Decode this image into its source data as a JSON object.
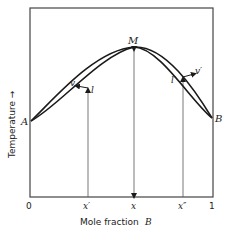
{
  "figure": {
    "y_axis_label": "Temperature →",
    "x_axis_label_prefix": "Mole fraction",
    "x_axis_label_var": "B",
    "x_ticks": [
      "0",
      "x′",
      "x",
      "x″",
      "1"
    ],
    "points": {
      "A": "A",
      "B": "B",
      "M": "M",
      "v": "v",
      "l": "l",
      "v_prime": "v′",
      "l_prime": "l′"
    },
    "colors": {
      "line": "#1a1a1a",
      "frame": "#444444",
      "background": "#ffffff"
    }
  }
}
